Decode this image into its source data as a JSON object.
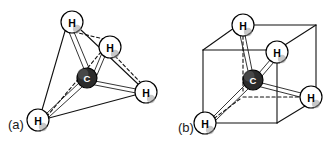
{
  "figure": {
    "background_color": "#ffffff",
    "line_color": "#111111",
    "carbon_fill": "#2b2b2b",
    "hydrogen_fill": "#ffffff",
    "width": 333,
    "height": 145
  },
  "panels": [
    {
      "id": "a",
      "label": "(a)",
      "shape": "tetrahedron",
      "atoms": [
        {
          "element": "H",
          "label": "H",
          "position": "top-apex",
          "cx": 72,
          "cy": 22,
          "r": 11
        },
        {
          "element": "H",
          "label": "H",
          "position": "back-right",
          "cx": 110,
          "cy": 47,
          "r": 11
        },
        {
          "element": "H",
          "label": "H",
          "position": "front-right",
          "cx": 146,
          "cy": 92,
          "r": 11
        },
        {
          "element": "H",
          "label": "H",
          "position": "front-left-bottom",
          "cx": 38,
          "cy": 120,
          "r": 11
        },
        {
          "element": "C",
          "label": "C",
          "position": "center",
          "cx": 87,
          "cy": 78,
          "r": 10
        }
      ],
      "bonds": [
        {
          "from": "C",
          "to": "H-top-apex",
          "style": "solid"
        },
        {
          "from": "C",
          "to": "H-back-right",
          "style": "solid"
        },
        {
          "from": "C",
          "to": "H-front-right",
          "style": "solid"
        },
        {
          "from": "C",
          "to": "H-front-left-bottom",
          "style": "solid"
        }
      ],
      "frame_edges": [
        {
          "from": "H-top-apex",
          "to": "H-front-left-bottom",
          "style": "solid"
        },
        {
          "from": "H-top-apex",
          "to": "H-front-right",
          "style": "solid"
        },
        {
          "from": "H-top-apex",
          "to": "H-back-right",
          "style": "dashed"
        },
        {
          "from": "H-front-left-bottom",
          "to": "H-front-right",
          "style": "solid"
        },
        {
          "from": "H-front-left-bottom",
          "to": "H-back-right",
          "style": "dashed"
        },
        {
          "from": "H-back-right",
          "to": "H-front-right",
          "style": "dashed"
        }
      ]
    },
    {
      "id": "b",
      "label": "(b)",
      "shape": "cube",
      "atoms": [
        {
          "element": "H",
          "label": "H",
          "position": "top-back-left",
          "cx": 243,
          "cy": 25,
          "r": 11
        },
        {
          "element": "H",
          "label": "H",
          "position": "top-front-right",
          "cx": 277,
          "cy": 52,
          "r": 11
        },
        {
          "element": "H",
          "label": "H",
          "position": "bottom-front-left",
          "cx": 205,
          "cy": 123,
          "r": 11
        },
        {
          "element": "H",
          "label": "H",
          "position": "bottom-back-right",
          "cx": 311,
          "cy": 97,
          "r": 11
        },
        {
          "element": "C",
          "label": "C",
          "position": "center",
          "cx": 253,
          "cy": 80,
          "r": 10
        }
      ],
      "bonds": [
        {
          "from": "C",
          "to": "H-top-back-left",
          "style": "solid"
        },
        {
          "from": "C",
          "to": "H-top-front-right",
          "style": "solid"
        },
        {
          "from": "C",
          "to": "H-bottom-front-left",
          "style": "solid"
        },
        {
          "from": "C",
          "to": "H-bottom-back-right",
          "style": "solid"
        }
      ],
      "cube_vertices": {
        "front_top_left": {
          "x": 203,
          "y": 50
        },
        "front_top_right": {
          "x": 277,
          "y": 50
        },
        "front_bot_left": {
          "x": 203,
          "y": 123
        },
        "front_bot_right": {
          "x": 277,
          "y": 123
        },
        "back_top_left": {
          "x": 243,
          "y": 25
        },
        "back_top_right": {
          "x": 316,
          "y": 25
        },
        "back_bot_left": {
          "x": 243,
          "y": 97
        },
        "back_bot_right": {
          "x": 316,
          "y": 97
        }
      },
      "hidden_edges": [
        "back_top_left-back_bot_left",
        "back_bot_left-front_bot_left",
        "back_bot_left-back_bot_right"
      ]
    }
  ]
}
